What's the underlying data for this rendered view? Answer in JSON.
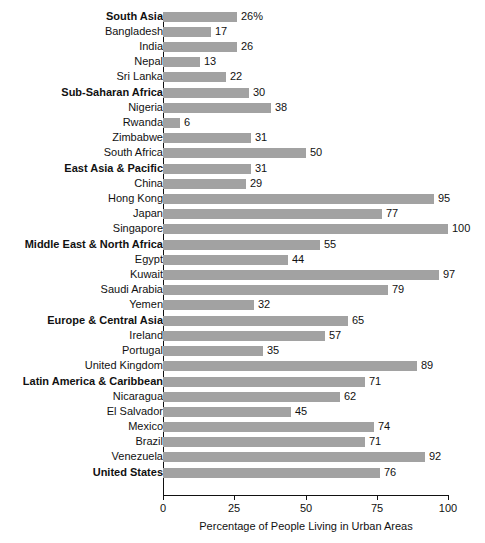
{
  "chart_data": {
    "type": "bar",
    "orientation": "horizontal",
    "title": "",
    "xlabel": "Percentage of People Living in Urban Areas",
    "ylabel": "",
    "xlim": [
      0,
      100
    ],
    "xticks": [
      "0",
      "25",
      "50",
      "75",
      "100"
    ],
    "xtick_values": [
      0,
      25,
      50,
      75,
      100
    ],
    "grid": false,
    "legend": null,
    "bar_color": "#a2a2a2",
    "value_label_suffix_first": "%",
    "categories": [
      "South Asia",
      "Bangladesh",
      "India",
      "Nepal",
      "Sri Lanka",
      "Sub-Saharan Africa",
      "Nigeria",
      "Rwanda",
      "Zimbabwe",
      "South Africa",
      "East Asia & Pacific",
      "China",
      "Hong Kong",
      "Japan",
      "Singapore",
      "Middle East & North Africa",
      "Egypt",
      "Kuwait",
      "Saudi Arabia",
      "Yemen",
      "Europe & Central Asia",
      "Ireland",
      "Portugal",
      "United Kingdom",
      "Latin America & Caribbean",
      "Nicaragua",
      "El Salvador",
      "Mexico",
      "Brazil",
      "Venezuela",
      "United States"
    ],
    "values": [
      26,
      17,
      26,
      13,
      22,
      30,
      38,
      6,
      31,
      50,
      31,
      29,
      95,
      77,
      100,
      55,
      44,
      97,
      79,
      32,
      65,
      57,
      35,
      89,
      71,
      62,
      45,
      74,
      71,
      92,
      76
    ],
    "rows": [
      {
        "label": "South Asia",
        "value": 26,
        "display": "26%",
        "is_region": true,
        "group_start": true
      },
      {
        "label": "Bangladesh",
        "value": 17,
        "display": "17",
        "is_region": false,
        "group_start": false
      },
      {
        "label": "India",
        "value": 26,
        "display": "26",
        "is_region": false,
        "group_start": false
      },
      {
        "label": "Nepal",
        "value": 13,
        "display": "13",
        "is_region": false,
        "group_start": false
      },
      {
        "label": "Sri Lanka",
        "value": 22,
        "display": "22",
        "is_region": false,
        "group_start": false
      },
      {
        "label": "Sub-Saharan Africa",
        "value": 30,
        "display": "30",
        "is_region": true,
        "group_start": true
      },
      {
        "label": "Nigeria",
        "value": 38,
        "display": "38",
        "is_region": false,
        "group_start": false
      },
      {
        "label": "Rwanda",
        "value": 6,
        "display": "6",
        "is_region": false,
        "group_start": false
      },
      {
        "label": "Zimbabwe",
        "value": 31,
        "display": "31",
        "is_region": false,
        "group_start": false
      },
      {
        "label": "South Africa",
        "value": 50,
        "display": "50",
        "is_region": false,
        "group_start": false
      },
      {
        "label": "East Asia & Pacific",
        "value": 31,
        "display": "31",
        "is_region": true,
        "group_start": true
      },
      {
        "label": "China",
        "value": 29,
        "display": "29",
        "is_region": false,
        "group_start": false
      },
      {
        "label": "Hong Kong",
        "value": 95,
        "display": "95",
        "is_region": false,
        "group_start": false
      },
      {
        "label": "Japan",
        "value": 77,
        "display": "77",
        "is_region": false,
        "group_start": false
      },
      {
        "label": "Singapore",
        "value": 100,
        "display": "100",
        "is_region": false,
        "group_start": false
      },
      {
        "label": "Middle East & North Africa",
        "value": 55,
        "display": "55",
        "is_region": true,
        "group_start": true
      },
      {
        "label": "Egypt",
        "value": 44,
        "display": "44",
        "is_region": false,
        "group_start": false
      },
      {
        "label": "Kuwait",
        "value": 97,
        "display": "97",
        "is_region": false,
        "group_start": false
      },
      {
        "label": "Saudi Arabia",
        "value": 79,
        "display": "79",
        "is_region": false,
        "group_start": false
      },
      {
        "label": "Yemen",
        "value": 32,
        "display": "32",
        "is_region": false,
        "group_start": false
      },
      {
        "label": "Europe & Central Asia",
        "value": 65,
        "display": "65",
        "is_region": true,
        "group_start": true
      },
      {
        "label": "Ireland",
        "value": 57,
        "display": "57",
        "is_region": false,
        "group_start": false
      },
      {
        "label": "Portugal",
        "value": 35,
        "display": "35",
        "is_region": false,
        "group_start": false
      },
      {
        "label": "United Kingdom",
        "value": 89,
        "display": "89",
        "is_region": false,
        "group_start": false
      },
      {
        "label": "Latin America & Caribbean",
        "value": 71,
        "display": "71",
        "is_region": true,
        "group_start": true
      },
      {
        "label": "Nicaragua",
        "value": 62,
        "display": "62",
        "is_region": false,
        "group_start": false
      },
      {
        "label": "El Salvador",
        "value": 45,
        "display": "45",
        "is_region": false,
        "group_start": false
      },
      {
        "label": "Mexico",
        "value": 74,
        "display": "74",
        "is_region": false,
        "group_start": false
      },
      {
        "label": "Brazil",
        "value": 71,
        "display": "71",
        "is_region": false,
        "group_start": false
      },
      {
        "label": "Venezuela",
        "value": 92,
        "display": "92",
        "is_region": false,
        "group_start": false
      },
      {
        "label": "United States",
        "value": 76,
        "display": "76",
        "is_region": true,
        "group_start": true
      }
    ]
  }
}
